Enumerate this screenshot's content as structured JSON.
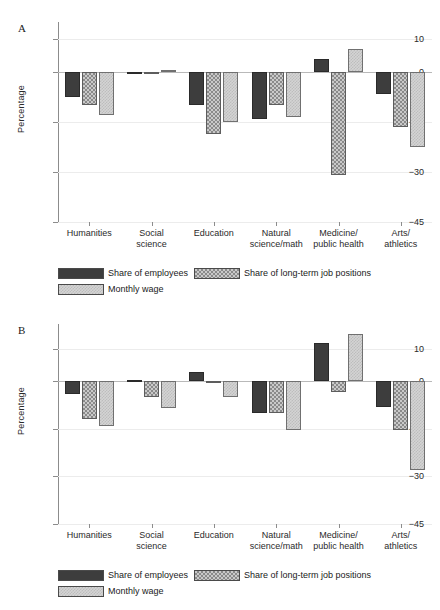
{
  "figure": {
    "ylabel": "Percentage",
    "panels": [
      {
        "letter": "A"
      },
      {
        "letter": "B"
      }
    ],
    "legend": {
      "items": [
        {
          "key": "employees",
          "label": "Share of employees",
          "pattern": "solid-dark"
        },
        {
          "key": "longterm",
          "label": "Share of long-term job positions",
          "pattern": "checkered"
        },
        {
          "key": "wage",
          "label": "Monthly wage",
          "pattern": "light-stipple"
        }
      ]
    },
    "yticks": [
      "10",
      "0",
      "-15",
      "-30",
      "-45"
    ],
    "categories": [
      {
        "lines": [
          "Humanities"
        ]
      },
      {
        "lines": [
          "Social",
          "science"
        ]
      },
      {
        "lines": [
          "Education"
        ]
      },
      {
        "lines": [
          "Natural",
          "science/math"
        ]
      },
      {
        "lines": [
          "Medicine/",
          "public health"
        ]
      },
      {
        "lines": [
          "Arts/",
          "athletics"
        ]
      }
    ]
  },
  "colors": {
    "employees": "#3d3d3d",
    "longterm": "#8a8a8a",
    "wage": "#d4d4d4",
    "axis": "#8c8c8c",
    "grid": "#ececec",
    "background": "#ffffff"
  },
  "chart_data": [
    {
      "type": "bar",
      "panel": "A",
      "title": "",
      "xlabel": "",
      "ylabel": "Percentage",
      "ylim": [
        -45,
        15
      ],
      "yticks": [
        10,
        0,
        -15,
        -30,
        -45
      ],
      "grid": true,
      "legend_position": "bottom",
      "categories": [
        "Humanities",
        "Social science",
        "Education",
        "Natural science/math",
        "Medicine/public health",
        "Arts/athletics"
      ],
      "series": [
        {
          "name": "Share of employees",
          "values": [
            -7.5,
            -0.2,
            -10.0,
            -14.0,
            4.0,
            -6.5
          ]
        },
        {
          "name": "Share of long-term job positions",
          "values": [
            -10.0,
            -0.2,
            -18.5,
            -10.0,
            -31.0,
            -16.5
          ]
        },
        {
          "name": "Monthly wage",
          "values": [
            -13.0,
            0.5,
            -15.0,
            -13.5,
            7.0,
            -22.5
          ]
        }
      ]
    },
    {
      "type": "bar",
      "panel": "B",
      "title": "",
      "xlabel": "",
      "ylabel": "Percentage",
      "ylim": [
        -45,
        18
      ],
      "yticks": [
        10,
        0,
        -15,
        -30,
        -45
      ],
      "grid": true,
      "legend_position": "bottom",
      "categories": [
        "Humanities",
        "Social science",
        "Education",
        "Natural science/math",
        "Medicine/public health",
        "Arts/athletics"
      ],
      "series": [
        {
          "name": "Share of employees",
          "values": [
            -4.0,
            0.3,
            3.0,
            -10.0,
            12.0,
            -8.0
          ]
        },
        {
          "name": "Share of long-term job positions",
          "values": [
            -12.0,
            -5.0,
            -0.2,
            -10.0,
            -3.5,
            -15.5
          ]
        },
        {
          "name": "Monthly wage",
          "values": [
            -14.0,
            -8.5,
            -5.0,
            -15.5,
            15.0,
            -28.0
          ]
        }
      ]
    }
  ]
}
